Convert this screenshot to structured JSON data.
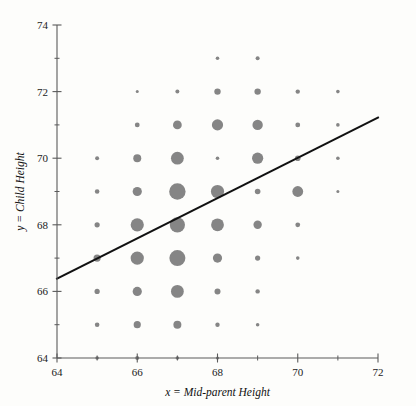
{
  "chart_data": {
    "type": "scatter",
    "title": "",
    "subtitle": "",
    "xlabel": "x = Mid-parent Height",
    "ylabel": "y = Child Height",
    "xlim": [
      64,
      72
    ],
    "ylim": [
      63.3,
      74
    ],
    "xticks": [
      64,
      66,
      68,
      70,
      72
    ],
    "xticklabels": [
      "64",
      "66",
      "68",
      "70",
      "72"
    ],
    "xminorticks": [
      65,
      67,
      69,
      71
    ],
    "yticks": [
      64,
      66,
      68,
      70,
      72,
      74
    ],
    "yticklabels": [
      "64",
      "66",
      "68",
      "70",
      "72",
      "74"
    ],
    "yminorticks": [
      65,
      67,
      69,
      71,
      73
    ],
    "grid": false,
    "legend": null,
    "marker_color": "#858585",
    "line_color": "#111111",
    "size_encoding": "bubble radius proportional to count of observations at each (x, y) grid cell",
    "fit_line": {
      "label": "regression line",
      "x0": 64,
      "y0": 66.38,
      "x1": 72,
      "y1": 71.22
    },
    "points": [
      {
        "x": 65,
        "y": 70,
        "r": 2.0
      },
      {
        "x": 65,
        "y": 69,
        "r": 2.3
      },
      {
        "x": 65,
        "y": 68,
        "r": 2.6
      },
      {
        "x": 65,
        "y": 67,
        "r": 3.6
      },
      {
        "x": 65,
        "y": 66,
        "r": 2.6
      },
      {
        "x": 65,
        "y": 65,
        "r": 2.3
      },
      {
        "x": 65,
        "y": 64,
        "r": 1.8
      },
      {
        "x": 66,
        "y": 72,
        "r": 1.5
      },
      {
        "x": 66,
        "y": 71,
        "r": 2.4
      },
      {
        "x": 66,
        "y": 70,
        "r": 4.0
      },
      {
        "x": 66,
        "y": 69,
        "r": 4.6
      },
      {
        "x": 66,
        "y": 68,
        "r": 6.6
      },
      {
        "x": 66,
        "y": 67,
        "r": 6.6
      },
      {
        "x": 66,
        "y": 66,
        "r": 4.6
      },
      {
        "x": 66,
        "y": 65,
        "r": 3.6
      },
      {
        "x": 66,
        "y": 64,
        "r": 2.0
      },
      {
        "x": 67,
        "y": 72,
        "r": 2.0
      },
      {
        "x": 67,
        "y": 71,
        "r": 4.4
      },
      {
        "x": 67,
        "y": 70,
        "r": 6.4
      },
      {
        "x": 67,
        "y": 69,
        "r": 8.2
      },
      {
        "x": 67,
        "y": 68,
        "r": 7.6
      },
      {
        "x": 67,
        "y": 67,
        "r": 8.0
      },
      {
        "x": 67,
        "y": 66,
        "r": 6.4
      },
      {
        "x": 67,
        "y": 65,
        "r": 4.0
      },
      {
        "x": 67,
        "y": 64,
        "r": 1.8
      },
      {
        "x": 68,
        "y": 73,
        "r": 1.8
      },
      {
        "x": 68,
        "y": 72,
        "r": 3.2
      },
      {
        "x": 68,
        "y": 71,
        "r": 5.6
      },
      {
        "x": 68,
        "y": 70,
        "r": 1.8
      },
      {
        "x": 68,
        "y": 69,
        "r": 6.6
      },
      {
        "x": 68,
        "y": 68,
        "r": 6.4
      },
      {
        "x": 68,
        "y": 67,
        "r": 4.6
      },
      {
        "x": 68,
        "y": 66,
        "r": 3.0
      },
      {
        "x": 68,
        "y": 65,
        "r": 2.2
      },
      {
        "x": 68,
        "y": 64,
        "r": 1.6
      },
      {
        "x": 69,
        "y": 73,
        "r": 2.0
      },
      {
        "x": 69,
        "y": 72,
        "r": 3.2
      },
      {
        "x": 69,
        "y": 71,
        "r": 5.2
      },
      {
        "x": 69,
        "y": 70,
        "r": 5.6
      },
      {
        "x": 69,
        "y": 69,
        "r": 2.8
      },
      {
        "x": 69,
        "y": 68,
        "r": 4.2
      },
      {
        "x": 69,
        "y": 67,
        "r": 2.6
      },
      {
        "x": 69,
        "y": 66,
        "r": 2.2
      },
      {
        "x": 69,
        "y": 65,
        "r": 1.8
      },
      {
        "x": 70,
        "y": 72,
        "r": 2.2
      },
      {
        "x": 70,
        "y": 71,
        "r": 2.4
      },
      {
        "x": 70,
        "y": 70,
        "r": 2.8
      },
      {
        "x": 70,
        "y": 69,
        "r": 5.4
      },
      {
        "x": 70,
        "y": 68,
        "r": 2.4
      },
      {
        "x": 70,
        "y": 67,
        "r": 1.8
      },
      {
        "x": 71,
        "y": 72,
        "r": 1.8
      },
      {
        "x": 71,
        "y": 71,
        "r": 1.8
      },
      {
        "x": 71,
        "y": 70,
        "r": 1.8
      },
      {
        "x": 71,
        "y": 69,
        "r": 1.5
      }
    ]
  }
}
